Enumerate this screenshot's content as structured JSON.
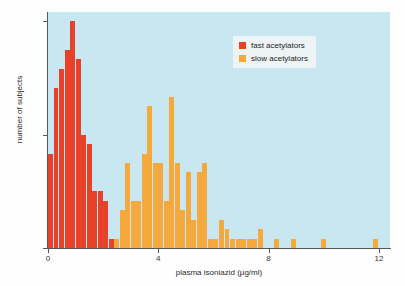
{
  "chart_data": {
    "type": "bar",
    "title": "",
    "subtitle": "",
    "xlabel": "plasma isoniazid (µg/ml)",
    "ylabel": "number of subjects",
    "xlim": [
      0,
      12.4
    ],
    "ylim": [
      0,
      25
    ],
    "xticks": [
      0,
      4,
      8,
      12
    ],
    "xtick_labels": [
      "0",
      "4",
      "8",
      "12"
    ],
    "yticks": [
      0,
      12,
      24
    ],
    "ytick_labels": [
      "0",
      "12",
      "24"
    ],
    "grid": false,
    "bin_width": 0.2,
    "legend_position": "top-right",
    "plot_background": "#c9e7f1",
    "series": [
      {
        "name": "fast acetylators",
        "color": "#e8412a",
        "x": [
          0.2,
          0.4,
          0.6,
          0.8,
          1.0,
          1.2,
          1.4,
          1.6,
          1.8,
          2.0,
          2.2,
          2.4
        ],
        "values": [
          10,
          17,
          19,
          21,
          24,
          20,
          12,
          11,
          6,
          6,
          5,
          1
        ]
      },
      {
        "name": "slow acetylators",
        "color": "#f5a93c",
        "x": [
          2.6,
          2.8,
          3.0,
          3.2,
          3.4,
          3.6,
          3.8,
          4.0,
          4.2,
          4.4,
          4.6,
          4.8,
          5.0,
          5.2,
          5.4,
          5.6,
          5.8,
          6.0,
          6.2,
          6.4,
          6.6,
          6.8,
          7.0,
          7.2,
          7.4,
          7.6,
          7.8,
          8.0,
          8.4,
          9.0,
          10.1,
          12.0
        ],
        "values": [
          1,
          4,
          9,
          5,
          5,
          10,
          15,
          9,
          9,
          5,
          16,
          9,
          4,
          8,
          3,
          8,
          9,
          1,
          1,
          3,
          2,
          1,
          1,
          1,
          1,
          1,
          2,
          0,
          1,
          1,
          1,
          1
        ]
      }
    ]
  },
  "legend": {
    "items": [
      {
        "label": "fast acetylators",
        "color": "#e8412a"
      },
      {
        "label": "slow acetylators",
        "color": "#f5a93c"
      }
    ]
  }
}
